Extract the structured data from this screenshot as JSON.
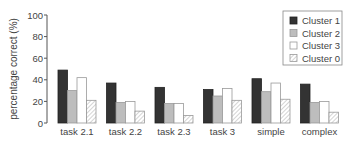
{
  "chart_data": {
    "type": "bar",
    "title": "",
    "xlabel": "",
    "ylabel": "percentage correct (%)",
    "ylim": [
      0,
      100
    ],
    "yticks": [
      0,
      20,
      40,
      60,
      80,
      100
    ],
    "grid": false,
    "legend_position": "upper right",
    "categories": [
      "task 2.1",
      "task 2.2",
      "task 2.3",
      "task 3",
      "simple",
      "complex"
    ],
    "series": [
      {
        "name": "Cluster 1",
        "color": "#333333",
        "pattern": "solid",
        "values": [
          49,
          37,
          33,
          31,
          41,
          36
        ]
      },
      {
        "name": "Cluster 2",
        "color": "#bdbdbd",
        "pattern": "solid",
        "values": [
          30,
          19,
          18,
          25,
          29,
          19
        ]
      },
      {
        "name": "Cluster 3",
        "color": "#ffffff",
        "pattern": "solid",
        "values": [
          42,
          20,
          18,
          32,
          37,
          20
        ]
      },
      {
        "name": "Cluster 0",
        "color": "#ffffff",
        "pattern": "hatched",
        "values": [
          21,
          11,
          7,
          21,
          22,
          10
        ]
      }
    ]
  }
}
